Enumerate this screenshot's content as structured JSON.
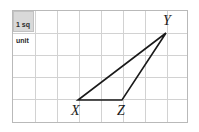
{
  "canvas": {
    "width": 199,
    "height": 132,
    "background": "#ffffff"
  },
  "grid": {
    "border_color": "#b9b9b9",
    "line_color": "#d2d2d2",
    "left": 12,
    "top": 10,
    "right": 188,
    "bottom": 123,
    "cell_size": 22,
    "columns": 8,
    "rows": 5
  },
  "unit_key": {
    "line1": "1 sq",
    "line2": "unit",
    "background": "#d9d9d9",
    "border": "#c2c2c2"
  },
  "chart_data": {
    "type": "scatter",
    "title": "",
    "xlabel": "",
    "ylabel": "",
    "grid": true,
    "legend": "none",
    "shape": "triangle",
    "unit_label": "1 sq unit",
    "stroke_color": "#1a1a1a",
    "stroke_width": 1.6,
    "grid_columns": 8,
    "grid_rows": 5,
    "xlim": [
      0,
      8
    ],
    "ylim": [
      0,
      5
    ],
    "vertices": [
      {
        "label": "X",
        "grid_x": 3,
        "grid_y": 1,
        "px": 78,
        "py": 100,
        "label_px": 71,
        "label_py": 104
      },
      {
        "label": "Z",
        "grid_x": 5,
        "grid_y": 1,
        "px": 122,
        "py": 100,
        "label_px": 117,
        "label_py": 104
      },
      {
        "label": "Y",
        "grid_x": 7,
        "grid_y": 4,
        "px": 166,
        "py": 33,
        "label_px": 163,
        "label_py": 14
      }
    ],
    "edges": [
      {
        "name": "XZ",
        "from": "X",
        "to": "Z"
      },
      {
        "name": "ZY",
        "from": "Z",
        "to": "Y"
      },
      {
        "name": "YX",
        "from": "Y",
        "to": "X"
      }
    ],
    "base_length_units": 2,
    "height_units": 3,
    "area_square_units": 3
  }
}
